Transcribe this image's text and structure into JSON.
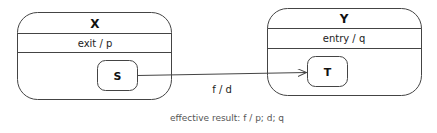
{
  "diagram": {
    "type": "state-machine",
    "states": [
      {
        "id": "X",
        "name": "X",
        "action": "exit / p",
        "substate": {
          "name": "S"
        }
      },
      {
        "id": "Y",
        "name": "Y",
        "action": "entry / q",
        "substate": {
          "name": "T"
        }
      }
    ],
    "transition": {
      "from": "S",
      "to": "T",
      "label": "f / d"
    },
    "caption": "effective result: f / p; d; q",
    "colors": {
      "stroke": "#444444",
      "text": "#111111",
      "caption": "#555555"
    }
  }
}
